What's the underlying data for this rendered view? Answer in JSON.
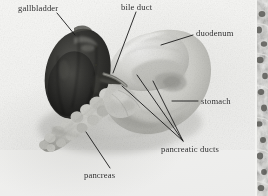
{
  "figure": {
    "type": "anatomical-photograph",
    "rendering": "black-and-white photograph",
    "background_color": "#f3f3f1",
    "label_color": "#2a2a2a",
    "leader_line_color": "#1a1a1a"
  },
  "labels": [
    {
      "id": "gallbladder",
      "text": "gallbladder",
      "leader": {
        "x1": 57,
        "y1": 13,
        "x2": 75,
        "y2": 35
      }
    },
    {
      "id": "bile-duct",
      "text": "bile duct",
      "leader": {
        "x1": 136,
        "y1": 12,
        "x2": 113,
        "y2": 73
      }
    },
    {
      "id": "duodenum",
      "text": "duodenum",
      "leader": {
        "x1": 193,
        "y1": 35,
        "x2": 161,
        "y2": 45
      }
    },
    {
      "id": "stomach",
      "text": "stomach",
      "leader": {
        "x1": 198,
        "y1": 101,
        "x2": 172,
        "y2": 101
      }
    },
    {
      "id": "pancreatic-ducts",
      "text": "pancreatic ducts",
      "leader": {
        "x1": 183,
        "y1": 141,
        "x2": 122,
        "y2": 86
      },
      "leader2": {
        "x1": 183,
        "y1": 141,
        "x2": 137,
        "y2": 75
      },
      "leader3": {
        "x1": 183,
        "y1": 141,
        "x2": 153,
        "y2": 81
      }
    },
    {
      "id": "pancreas",
      "text": "pancreas",
      "leader": {
        "x1": 110,
        "y1": 168,
        "x2": 86,
        "y2": 132
      }
    }
  ],
  "structures": [
    {
      "id": "gallbladder-mass",
      "tone": "very dark",
      "hex": "#2e2e2c"
    },
    {
      "id": "duodenum-mass",
      "tone": "light gray",
      "hex": "#d3d3cf"
    },
    {
      "id": "stomach-mass",
      "tone": "light gray",
      "hex": "#c9c9c5"
    },
    {
      "id": "pancreas-chain",
      "tone": "mid light gray",
      "hex": "#c0c0bb"
    },
    {
      "id": "bile-duct-strand",
      "tone": "mid gray",
      "hex": "#8b8b86"
    }
  ],
  "edge_plate": {
    "id": "adjacent-histology-plate",
    "description": "sliver of a neighbouring mottled histology micrograph at the right margin",
    "hex": "#b9b9b6"
  }
}
